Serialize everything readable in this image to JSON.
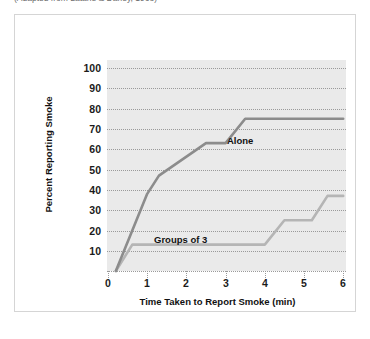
{
  "caption": {
    "text": "(Adapted from Latané & Darley, 1968)"
  },
  "chart_data": {
    "type": "line",
    "title": "",
    "xlabel": "Time Taken to Report Smoke (min)",
    "ylabel": "Percent Reporting Smoke",
    "xlim": [
      0,
      6
    ],
    "ylim": [
      0,
      105
    ],
    "xticks": [
      "0",
      "1",
      "2",
      "3",
      "4",
      "5",
      "6"
    ],
    "yticks": [
      "10",
      "20",
      "30",
      "40",
      "50",
      "60",
      "70",
      "80",
      "90",
      "100"
    ],
    "grid": "horizontal-dotted",
    "legend": "inline-labels",
    "plot_background": "#eaeaea",
    "series": [
      {
        "name": "Alone",
        "color": "#8c8c8c",
        "label_position": "inline-right-of-plateau",
        "points": [
          {
            "x": 0.2,
            "y": 0
          },
          {
            "x": 1.0,
            "y": 38
          },
          {
            "x": 1.3,
            "y": 47
          },
          {
            "x": 2.5,
            "y": 63
          },
          {
            "x": 3.0,
            "y": 63
          },
          {
            "x": 3.5,
            "y": 75
          },
          {
            "x": 6.0,
            "y": 75
          }
        ]
      },
      {
        "name": "Groups of 3",
        "color": "#b5b5b5",
        "label_position": "inline-above-plateau",
        "points": [
          {
            "x": 0.2,
            "y": 0
          },
          {
            "x": 0.62,
            "y": 13
          },
          {
            "x": 4.0,
            "y": 13
          },
          {
            "x": 4.5,
            "y": 25
          },
          {
            "x": 5.2,
            "y": 25
          },
          {
            "x": 5.6,
            "y": 37
          },
          {
            "x": 6.0,
            "y": 37
          }
        ]
      }
    ]
  }
}
